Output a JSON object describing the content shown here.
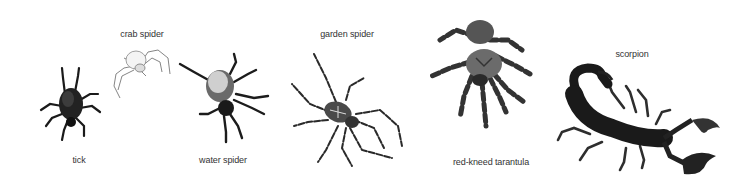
{
  "illustration": {
    "background": "#ffffff",
    "label_color": "#333333",
    "animals": [
      {
        "id": "tick",
        "label": "tick"
      },
      {
        "id": "crab-spider",
        "label": "crab spider"
      },
      {
        "id": "water-spider",
        "label": "water spider"
      },
      {
        "id": "garden-spider",
        "label": "garden spider"
      },
      {
        "id": "red-kneed-tarantula",
        "label": "red-kneed tarantula"
      },
      {
        "id": "scorpion",
        "label": "scorpion"
      }
    ]
  }
}
